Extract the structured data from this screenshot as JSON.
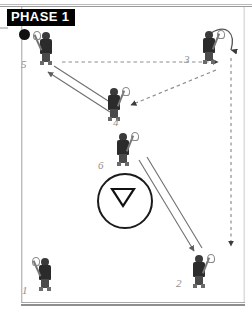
{
  "title_banner": {
    "label": "PHASE 1"
  },
  "colors": {
    "banner_bg": "#000000",
    "banner_text": "#ffffff",
    "ball": "#111111",
    "player_body": "#2b2b2b",
    "number_text": "#8e8e8e",
    "line_solid": "#6f6f6f",
    "line_dotted": "#9a9a9a",
    "circle_stroke": "#1b1b1b",
    "frame": "#b9b9b9"
  },
  "field": {
    "name": "lacrosse-field-diagram",
    "border": "double-grey-rectangle",
    "faceoff_circle": {
      "shape": "circle-with-down-triangle",
      "cx": 123,
      "cy": 199,
      "r": 26
    }
  },
  "ball": {
    "label": "ball",
    "x": 24,
    "y": 34
  },
  "players": [
    {
      "number": "1",
      "x": 32,
      "y": 258,
      "stick": "left",
      "label_dx": -10,
      "label_dy": 26
    },
    {
      "number": "2",
      "x": 186,
      "y": 255,
      "stick": "right",
      "label_dx": -10,
      "label_dy": 22
    },
    {
      "number": "3",
      "x": 196,
      "y": 31,
      "stick": "right",
      "label_dx": -12,
      "label_dy": 22
    },
    {
      "number": "4",
      "x": 101,
      "y": 88,
      "stick": "right",
      "label_dx": 12,
      "label_dy": 28
    },
    {
      "number": "5",
      "x": 33,
      "y": 32,
      "stick": "left",
      "label_dx": -12,
      "label_dy": 26
    },
    {
      "number": "6",
      "x": 110,
      "y": 133,
      "stick": "right",
      "label_dx": -12,
      "label_dy": 26
    }
  ],
  "arrows": [
    {
      "name": "pass-5-to-3",
      "style": "dotted",
      "from": "player-5",
      "to": "player-3"
    },
    {
      "name": "pass-3-to-4",
      "style": "dotted",
      "from": "player-3",
      "to": "player-4"
    },
    {
      "name": "run-4-to-5",
      "style": "solid-double",
      "from": "player-4",
      "to": "player-5"
    },
    {
      "name": "run-6-to-2",
      "style": "solid-double",
      "from": "player-6",
      "to": "player-2"
    },
    {
      "name": "curl-3-around",
      "style": "curved",
      "from": "player-3",
      "to": "right-lane"
    },
    {
      "name": "run-3-down-to-2",
      "style": "dotted",
      "from": "right-lane",
      "to": "player-2"
    }
  ]
}
